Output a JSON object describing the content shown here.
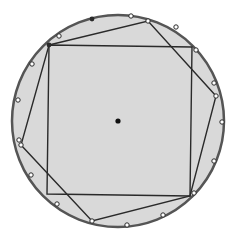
{
  "figure": {
    "colors": {
      "fill": "#d9d9d9",
      "stroke": "#2a2a2a",
      "circle_stroke": "#555555",
      "point_fill": "#ffffff",
      "center_fill": "#111111"
    },
    "circle": {
      "cx": 118,
      "cy": 121,
      "r": 106
    },
    "center_point": {
      "x": 118,
      "y": 121
    },
    "square": [
      [
        49,
        45
      ],
      [
        192,
        47
      ],
      [
        190,
        196
      ],
      [
        47,
        194
      ]
    ],
    "hexagon": [
      [
        49,
        45
      ],
      [
        148,
        21
      ],
      [
        216,
        96
      ],
      [
        190,
        196
      ],
      [
        92,
        221
      ],
      [
        21,
        145
      ]
    ],
    "dark_vertices": [
      [
        49,
        45
      ],
      [
        92,
        19
      ]
    ],
    "circumference_points": [
      [
        59,
        36
      ],
      [
        131,
        16
      ],
      [
        148,
        21
      ],
      [
        176,
        27
      ],
      [
        196,
        50
      ],
      [
        214,
        83
      ],
      [
        216,
        96
      ],
      [
        222,
        122
      ],
      [
        214,
        161
      ],
      [
        194,
        193
      ],
      [
        163,
        215
      ],
      [
        127,
        225
      ],
      [
        92,
        221
      ],
      [
        57,
        204
      ],
      [
        31,
        175
      ],
      [
        21,
        145
      ],
      [
        19,
        140
      ],
      [
        18,
        100
      ],
      [
        32,
        64
      ]
    ]
  }
}
